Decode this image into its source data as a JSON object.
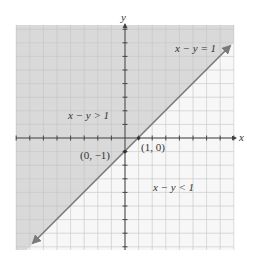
{
  "figure": {
    "axis_labels": {
      "x": "x",
      "y": "y"
    },
    "equation_label": "x − y = 1",
    "region_above_label": "x − y > 1",
    "region_below_label": "x − y < 1",
    "points": [
      {
        "label": "(1, 0)",
        "x": 1,
        "y": 0
      },
      {
        "label": "(0, −1)",
        "x": 0,
        "y": -1
      }
    ],
    "colors": {
      "shaded_region": "#d9d9d9",
      "unshaded_region": "#f7f7f7",
      "grid": "#c4c4c4",
      "boundary_line": "#7a7a7a",
      "axes": "#444444"
    }
  },
  "chart_data": {
    "type": "line",
    "title": "",
    "xlabel": "x",
    "ylabel": "y",
    "xlim": [
      -8,
      8
    ],
    "ylim": [
      -8,
      8
    ],
    "grid": true,
    "series": [
      {
        "name": "x − y = 1",
        "equation": "y = x − 1",
        "x": [
          -7,
          8
        ],
        "y": [
          -8,
          7
        ]
      }
    ],
    "shaded_region": "x − y > 1 (above-left of the line y = x − 1)",
    "annotations": [
      "x − y = 1",
      "x − y > 1",
      "x − y < 1",
      "(1, 0)",
      "(0, −1)"
    ]
  }
}
